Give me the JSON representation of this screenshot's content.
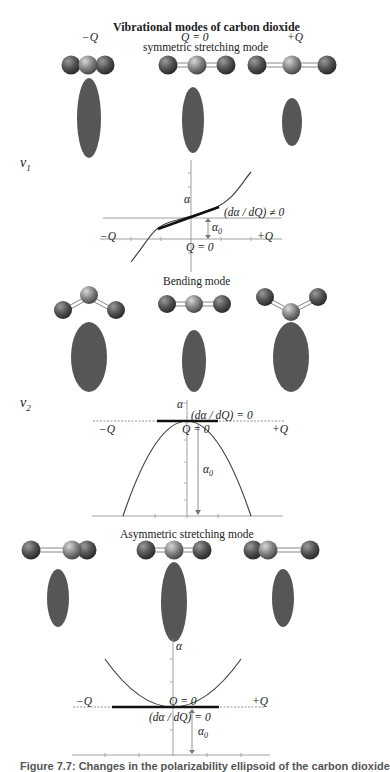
{
  "title": "Vibrational modes of carbon dioxide",
  "coordinate_labels": {
    "minus": "−Q",
    "zero": "Q = 0",
    "plus": "+Q"
  },
  "modes": [
    {
      "name": "symmetric stretching mode",
      "symbol": "ν",
      "subscript": "1",
      "graph": {
        "y_axis_label": "α",
        "x_left_label": "−Q",
        "x_right_label": "+Q",
        "origin_label": "Q = 0",
        "slope_label": "(dα / dQ) ≠ 0",
        "offset_label": "α",
        "offset_subscript": "0",
        "curve": "cubic-like increasing"
      }
    },
    {
      "name": "Bending mode",
      "symbol": "ν",
      "subscript": "2",
      "graph": {
        "y_axis_label": "α",
        "x_left_label": "−Q",
        "x_right_label": "+Q",
        "origin_label": "Q = 0",
        "slope_label": "(dα / dQ) = 0",
        "offset_label": "α",
        "offset_subscript": "0",
        "curve": "downward parabola"
      }
    },
    {
      "name": "Asymmetric stretching mode",
      "graph": {
        "y_axis_label": "α",
        "x_left_label": "−Q",
        "x_right_label": "+Q",
        "origin_label": "Q = 0",
        "slope_label": "(dα / dQ) = 0",
        "offset_label": "α",
        "offset_subscript": "0",
        "curve": "upward parabola"
      }
    }
  ],
  "caption": "Figure 7.7: Changes in the polarizability ellipsoid of the carbon dioxide",
  "colors": {
    "oxygen": "#5a5a5a",
    "carbon": "#8a8a8a",
    "ellipsoid": "#555555",
    "axis": "#777777",
    "curve": "#444444",
    "tangent": "#111111"
  }
}
